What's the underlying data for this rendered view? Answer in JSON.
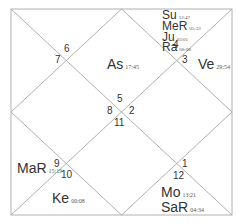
{
  "chart_type": "North Indian Kundali",
  "colors": {
    "line": "#b0b0b0",
    "text": "#333333",
    "background": "#ffffff"
  },
  "houses": {
    "h1": "1",
    "h2": "2",
    "h3": "3",
    "h4": "4",
    "h5": "5",
    "h6": "6",
    "h7": "7",
    "h8": "8",
    "h9": "9",
    "h10": "10",
    "h11": "11",
    "h12": "12"
  },
  "planets": {
    "su": {
      "name": "Su",
      "deg": "12:47"
    },
    "mer": {
      "name": "MeR",
      "deg": "05:33"
    },
    "ju": {
      "name": "Ju",
      "deg": "03:01"
    },
    "ra": {
      "name": "Ra",
      "deg": "00:08"
    },
    "as": {
      "name": "As",
      "deg": "17:45"
    },
    "ve": {
      "name": "Ve",
      "deg": "29:54"
    },
    "mar": {
      "name": "MaR",
      "deg": "15:19"
    },
    "ke": {
      "name": "Ke",
      "deg": "00:08"
    },
    "mo": {
      "name": "Mo",
      "deg": "13:21"
    },
    "sar": {
      "name": "SaR",
      "deg": "04:34"
    }
  }
}
